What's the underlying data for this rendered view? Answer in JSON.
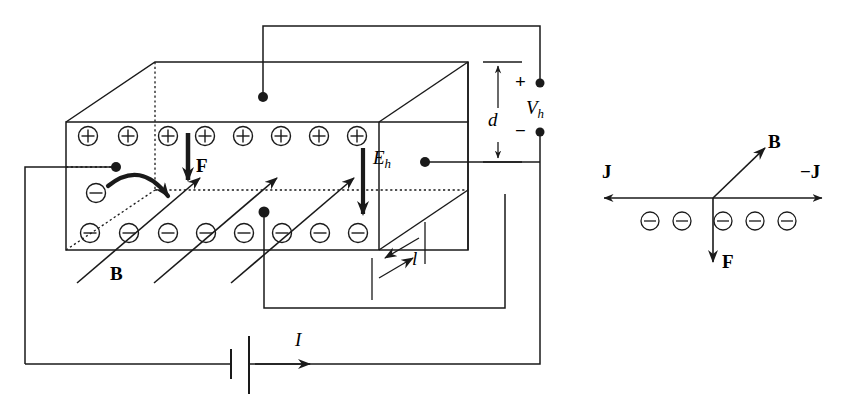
{
  "figure": {
    "stroke_color": "#1a1a1a",
    "background_color": "#ffffff",
    "width": 860,
    "height": 411
  },
  "main_diagram": {
    "name": "hall-effect-slab",
    "slab": {
      "top_charge_row": {
        "symbol": "+",
        "count": 8,
        "label": "positive-charge-row"
      },
      "bottom_charge_row": {
        "symbol": "−",
        "count": 8,
        "label": "negative-charge-row"
      },
      "deflected_electron": {
        "symbol": "−",
        "label": "deflected-electron"
      }
    },
    "labels": {
      "force": "F",
      "hall_field": "E",
      "hall_field_subscript": "h",
      "magnetic_field": "B",
      "thickness": "d",
      "length": "l",
      "current": "I",
      "hall_voltage": "V",
      "hall_voltage_subscript": "h",
      "plus_terminal": "+",
      "minus_terminal": "−"
    },
    "b_field_arrow_count": 3
  },
  "side_diagram": {
    "name": "current-density-vector-diagram",
    "labels": {
      "current_density_left": "J",
      "current_density_right": "−J",
      "magnetic_field": "B",
      "force": "F"
    },
    "electron_row": {
      "symbol": "−",
      "count": 5,
      "label": "electron-row"
    }
  }
}
